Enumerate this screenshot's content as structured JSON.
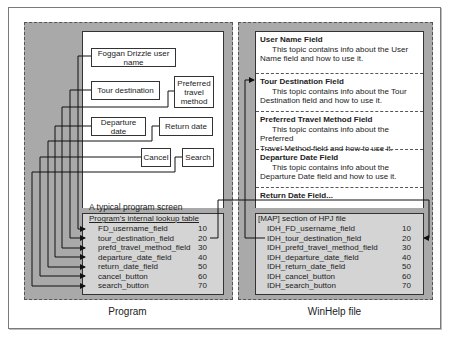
{
  "program": {
    "caption": "Program",
    "screen_label": "A typical program screen",
    "controls": [
      {
        "id": "username",
        "label": "Foggan Drizzle user name"
      },
      {
        "id": "tour",
        "label": "Tour destination"
      },
      {
        "id": "travel",
        "label": "Preferred travel method"
      },
      {
        "id": "departure",
        "label": "Departure date"
      },
      {
        "id": "return",
        "label": "Return date"
      },
      {
        "id": "cancel",
        "label": "Cancel"
      },
      {
        "id": "search",
        "label": "Search"
      }
    ],
    "lookup_table": {
      "title": "Program's internal lookup table",
      "rows": [
        {
          "name": "FD_username_field",
          "id": "10"
        },
        {
          "name": "tour_destination_field",
          "id": "20"
        },
        {
          "name": "prefd_travel_method_field",
          "id": "30"
        },
        {
          "name": "departure_date_field",
          "id": "40"
        },
        {
          "name": "return_date_field",
          "id": "50"
        },
        {
          "name": "cancel_button",
          "id": "60"
        },
        {
          "name": "search_button",
          "id": "70"
        }
      ]
    }
  },
  "winhelp": {
    "caption": "WinHelp file",
    "topics": [
      {
        "title": "User Name Field",
        "desc_1": "This topic contains info about the User",
        "desc_2": "Name field and how to use it."
      },
      {
        "title": "Tour Destination Field",
        "desc_1": "This topic contains info about the Tour",
        "desc_2": "Destination field and how to use it."
      },
      {
        "title": "Preferred Travel Method Field",
        "desc_1": "This topic contains info about the Preferred",
        "desc_2": "Travel Method field and how to use it."
      },
      {
        "title": "Departure Date Field",
        "desc_1": "This topic contains info about the",
        "desc_2": "Departure Date field and how to use it."
      },
      {
        "title": "Return Date Field...",
        "desc_1": "",
        "desc_2": ""
      }
    ],
    "map_section": {
      "title": "[MAP] section of HPJ file",
      "rows": [
        {
          "name": "IDH_FD_username_field",
          "id": "10"
        },
        {
          "name": "IDH_tour_destination_field",
          "id": "20"
        },
        {
          "name": "IDH_prefd_travel_method_field",
          "id": "30"
        },
        {
          "name": "IDH_departure_date_field",
          "id": "40"
        },
        {
          "name": "IDH_return_date_field",
          "id": "50"
        },
        {
          "name": "IDH_cancel_button",
          "id": "60"
        },
        {
          "name": "IDH_search_button",
          "id": "70"
        }
      ]
    }
  }
}
